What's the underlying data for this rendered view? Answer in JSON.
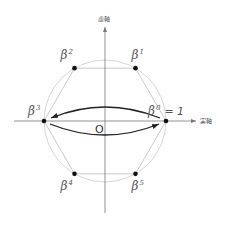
{
  "diagram": {
    "axes": {
      "x_label": "実軸",
      "y_label": "虚軸",
      "origin_label": "O"
    },
    "unit_circle": true,
    "points": [
      {
        "id": "b0",
        "base": "β",
        "exp": "0",
        "suffix": "= 1",
        "angle_deg": 0
      },
      {
        "id": "b1",
        "base": "β",
        "exp": "1",
        "suffix": "",
        "angle_deg": 60
      },
      {
        "id": "b2",
        "base": "β",
        "exp": "2",
        "suffix": "",
        "angle_deg": 120
      },
      {
        "id": "b3",
        "base": "β",
        "exp": "3",
        "suffix": "",
        "angle_deg": 180
      },
      {
        "id": "b4",
        "base": "β",
        "exp": "4",
        "suffix": "",
        "angle_deg": 240
      },
      {
        "id": "b5",
        "base": "β",
        "exp": "5",
        "suffix": "",
        "angle_deg": 300
      }
    ],
    "arrows": [
      {
        "from": "b0",
        "to": "b3",
        "side": "upper"
      },
      {
        "from": "b3",
        "to": "b0",
        "side": "lower"
      }
    ],
    "colors": {
      "circle": "#cccccc",
      "hexagon": "#bbbbbb",
      "axis": "#777777",
      "arrow": "#222222",
      "point": "#111111"
    }
  }
}
